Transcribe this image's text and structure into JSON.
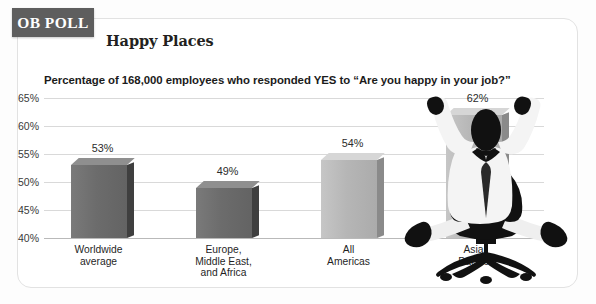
{
  "badge": {
    "label": "OB POLL"
  },
  "header": {
    "title": "Happy Places",
    "subtitle": "Percentage of 168,000 employees who responded YES to “Are you happy in your job?”"
  },
  "illustration": {
    "name": "cheering-office-worker-silhouette"
  },
  "colors": {
    "badge_background": "#5e5e5e",
    "card_border": "#e2e2e2",
    "gridline": "#d9d9d9",
    "bar_dark": "#6c6c6c",
    "bar_light": "#b6b6b6",
    "text": "#1b1b1b"
  },
  "chart_data": {
    "type": "bar",
    "title": "Happy Places",
    "subtitle": "Percentage of 168,000 employees who responded YES to “Are you happy in your job?”",
    "xlabel": "",
    "ylabel": "",
    "ylim": [
      40,
      65
    ],
    "yticks": [
      65,
      60,
      55,
      50,
      45,
      40
    ],
    "ytick_labels": [
      "65%",
      "60%",
      "55%",
      "50%",
      "45%",
      "40%"
    ],
    "grid": true,
    "legend": "none",
    "categories": [
      "Worldwide average",
      "Europe, Middle East, and Africa",
      "All Americas",
      "Asia Pacific"
    ],
    "category_lines": [
      [
        "Worldwide",
        "average"
      ],
      [
        "Europe,",
        "Middle East,",
        "and Africa"
      ],
      [
        "All",
        "Americas"
      ],
      [
        "Asia",
        "Pacific"
      ]
    ],
    "values": [
      53,
      49,
      54,
      62
    ],
    "data_labels": [
      "53%",
      "49%",
      "54%",
      "62%"
    ],
    "bar_styles": [
      "dark",
      "dark",
      "light",
      "light"
    ]
  }
}
